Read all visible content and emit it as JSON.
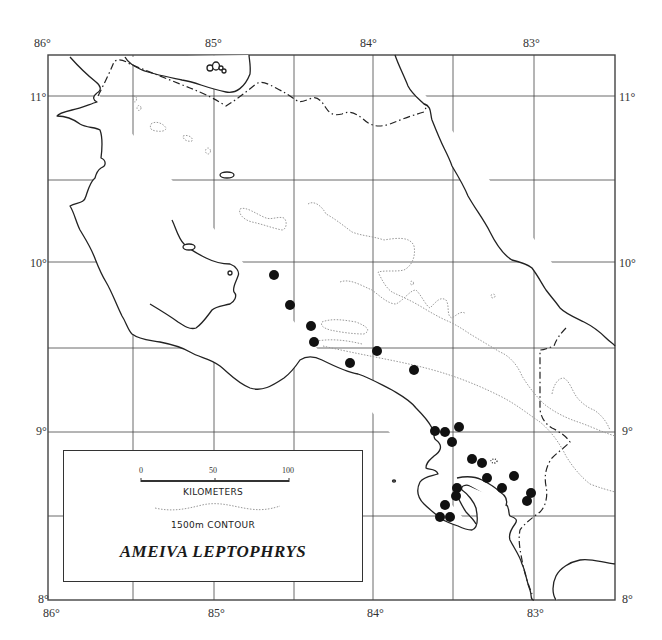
{
  "map": {
    "title": "AMEIVA LEPTOPHRYS",
    "frame": {
      "left": 48,
      "top": 55,
      "right": 615,
      "bottom": 600
    },
    "longitude_labels_top": [
      {
        "label": "86°",
        "x": 34,
        "y": 36
      },
      {
        "label": "85°",
        "x": 205,
        "y": 36
      },
      {
        "label": "84°",
        "x": 360,
        "y": 36
      },
      {
        "label": "83°",
        "x": 523,
        "y": 36
      }
    ],
    "longitude_labels_bottom": [
      {
        "label": "86°",
        "x": 43,
        "y": 606
      },
      {
        "label": "85°",
        "x": 208,
        "y": 606
      },
      {
        "label": "84°",
        "x": 367,
        "y": 606
      },
      {
        "label": "83°",
        "x": 527,
        "y": 606
      }
    ],
    "latitude_labels_left": [
      {
        "label": "11°",
        "x": 30,
        "y": 90
      },
      {
        "label": "10°",
        "x": 30,
        "y": 256
      },
      {
        "label": "9°",
        "x": 36,
        "y": 424
      },
      {
        "label": "8°",
        "x": 38,
        "y": 592
      }
    ],
    "latitude_labels_right": [
      {
        "label": "11°",
        "x": 619,
        "y": 90
      },
      {
        "label": "10°",
        "x": 619,
        "y": 256
      },
      {
        "label": "9°",
        "x": 622,
        "y": 424
      },
      {
        "label": "8°",
        "x": 622,
        "y": 592
      }
    ],
    "grid": {
      "vertical_x": [
        133,
        214,
        294,
        373,
        453,
        534
      ],
      "horizontal_y": [
        96,
        180,
        262,
        348,
        432,
        516
      ]
    },
    "colors": {
      "line": "#222222",
      "contour": "#9a9a9a",
      "dot": "#111111",
      "background": "#ffffff"
    },
    "locality_points": [
      {
        "x": 274,
        "y": 275
      },
      {
        "x": 290,
        "y": 305
      },
      {
        "x": 311,
        "y": 326
      },
      {
        "x": 314,
        "y": 342
      },
      {
        "x": 350,
        "y": 363
      },
      {
        "x": 377,
        "y": 351
      },
      {
        "x": 414,
        "y": 370
      },
      {
        "x": 435,
        "y": 431
      },
      {
        "x": 445,
        "y": 432
      },
      {
        "x": 459,
        "y": 427
      },
      {
        "x": 452,
        "y": 442
      },
      {
        "x": 472,
        "y": 459
      },
      {
        "x": 482,
        "y": 463
      },
      {
        "x": 487,
        "y": 478
      },
      {
        "x": 457,
        "y": 488
      },
      {
        "x": 456,
        "y": 496
      },
      {
        "x": 445,
        "y": 505
      },
      {
        "x": 440,
        "y": 517
      },
      {
        "x": 450,
        "y": 517
      },
      {
        "x": 502,
        "y": 488
      },
      {
        "x": 514,
        "y": 476
      },
      {
        "x": 531,
        "y": 493
      },
      {
        "x": 527,
        "y": 501
      }
    ]
  },
  "legend": {
    "scale_ticks": [
      "0",
      "50",
      "100"
    ],
    "scale_unit": "KILOMETERS",
    "contour_label": "1500m CONTOUR",
    "species_name": "AMEIVA LEPTOPHRYS"
  }
}
